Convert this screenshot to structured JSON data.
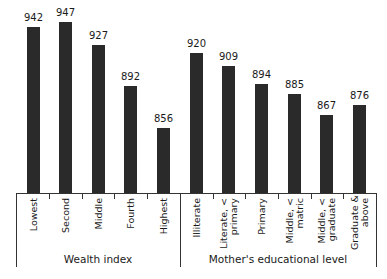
{
  "chart_data": {
    "type": "bar",
    "title": "",
    "xlabel": "",
    "ylabel": "",
    "grid": false,
    "groups": [
      {
        "name": "Wealth index",
        "categories": [
          "Lowest",
          "Second",
          "Middle",
          "Fourth",
          "Highest"
        ],
        "values": [
          942,
          947,
          927,
          892,
          856
        ]
      },
      {
        "name": "Mother's educational level",
        "categories": [
          "Illiterate",
          "Literate, < primary",
          "Primary",
          "Middle, < matric",
          "Middle, < graduate",
          "Graduate & above"
        ],
        "values": [
          920,
          909,
          894,
          885,
          867,
          876
        ]
      }
    ],
    "categories": [
      "Lowest",
      "Second",
      "Middle",
      "Fourth",
      "Highest",
      "Illiterate",
      "Literate, < primary",
      "Primary",
      "Middle, < matric",
      "Middle, < graduate",
      "Graduate & above"
    ],
    "values": [
      942,
      947,
      927,
      892,
      856,
      920,
      909,
      894,
      885,
      867,
      876
    ],
    "bar_color": "#2a2a2a"
  },
  "labels": {
    "group1": "Wealth index",
    "group2": "Mother's educational level",
    "cats": [
      [
        "Lowest"
      ],
      [
        "Second"
      ],
      [
        "Middle"
      ],
      [
        "Fourth"
      ],
      [
        "Highest"
      ],
      [
        "Illiterate"
      ],
      [
        "Literate, <",
        "primary"
      ],
      [
        "Primary"
      ],
      [
        "Middle, <",
        "matric"
      ],
      [
        "Middle, <",
        "graduate"
      ],
      [
        "Graduate &",
        "above"
      ]
    ]
  }
}
